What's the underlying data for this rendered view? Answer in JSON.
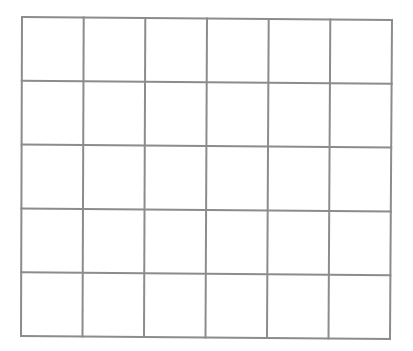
{
  "grid": {
    "rows": 5,
    "columns": 6,
    "line_color": "#8c8c8c",
    "background": "#ffffff",
    "line_width": 2,
    "corners": {
      "top_left": [
        22,
        17
      ],
      "top_right": [
        392,
        20
      ],
      "bottom_left": [
        21,
        336
      ],
      "bottom_right": [
        390,
        339
      ]
    }
  }
}
